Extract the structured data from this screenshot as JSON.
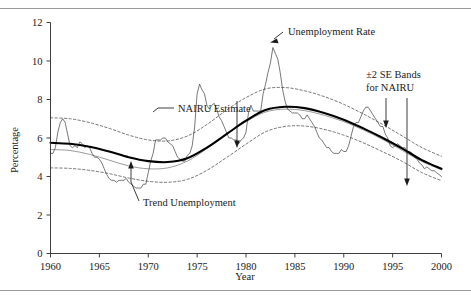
{
  "figure": {
    "y_axis_title": "Percentage",
    "x_axis_title": "Year"
  },
  "annotations": {
    "nairu": "NAIRU Estimate",
    "trend": "Trend Unemployment",
    "unemployment": "Unemployment Rate",
    "bands_line1": "±2 SE Bands",
    "bands_line2": "for NAIRU"
  },
  "ticks": {
    "y": [
      "0",
      "2",
      "4",
      "6",
      "8",
      "10",
      "12"
    ],
    "x": [
      "1960",
      "1965",
      "1970",
      "1975",
      "1980",
      "1985",
      "1990",
      "1995",
      "2000"
    ]
  },
  "chart_data": {
    "type": "line",
    "title": "",
    "xlabel": "Year",
    "ylabel": "Percentage",
    "xlim": [
      1960,
      2000
    ],
    "ylim": [
      0,
      12
    ],
    "yticks": [
      0,
      2,
      4,
      6,
      8,
      10,
      12
    ],
    "xticks": [
      1960,
      1965,
      1970,
      1975,
      1980,
      1985,
      1990,
      1995,
      2000
    ],
    "grid": false,
    "legend": "annotations-with-leader-lines",
    "colors": {
      "unemployment": "#3d3d3d",
      "nairu": "#000000",
      "trend": "#8f8f8f",
      "se_bands": "#4a4a4a"
    },
    "series": [
      {
        "name": "Unemployment Rate",
        "style": "solid-thin",
        "x": [
          1960.0,
          1960.25,
          1960.5,
          1960.75,
          1961.0,
          1961.25,
          1961.5,
          1961.75,
          1962.0,
          1962.25,
          1962.5,
          1962.75,
          1963.0,
          1963.25,
          1963.5,
          1963.75,
          1964.0,
          1964.25,
          1964.5,
          1964.75,
          1965.0,
          1965.25,
          1965.5,
          1965.75,
          1966.0,
          1966.25,
          1966.5,
          1966.75,
          1967.0,
          1967.25,
          1967.5,
          1967.75,
          1968.0,
          1968.25,
          1968.5,
          1968.75,
          1969.0,
          1969.25,
          1969.5,
          1969.75,
          1970.0,
          1970.25,
          1970.5,
          1970.75,
          1971.0,
          1971.25,
          1971.5,
          1971.75,
          1972.0,
          1972.25,
          1972.5,
          1972.75,
          1973.0,
          1973.25,
          1973.5,
          1973.75,
          1974.0,
          1974.25,
          1974.5,
          1974.75,
          1975.0,
          1975.25,
          1975.5,
          1975.75,
          1976.0,
          1976.25,
          1976.5,
          1976.75,
          1977.0,
          1977.25,
          1977.5,
          1977.75,
          1978.0,
          1978.25,
          1978.5,
          1978.75,
          1979.0,
          1979.25,
          1979.5,
          1979.75,
          1980.0,
          1980.25,
          1980.5,
          1980.75,
          1981.0,
          1981.25,
          1981.5,
          1981.75,
          1982.0,
          1982.25,
          1982.5,
          1982.75,
          1983.0,
          1983.25,
          1983.5,
          1983.75,
          1984.0,
          1984.25,
          1984.5,
          1984.75,
          1985.0,
          1985.25,
          1985.5,
          1985.75,
          1986.0,
          1986.25,
          1986.5,
          1986.75,
          1987.0,
          1987.25,
          1987.5,
          1987.75,
          1988.0,
          1988.25,
          1988.5,
          1988.75,
          1989.0,
          1989.25,
          1989.5,
          1989.75,
          1990.0,
          1990.25,
          1990.5,
          1990.75,
          1991.0,
          1991.25,
          1991.5,
          1991.75,
          1992.0,
          1992.25,
          1992.5,
          1992.75,
          1993.0,
          1993.25,
          1993.5,
          1993.75,
          1994.0,
          1994.25,
          1994.5,
          1994.75,
          1995.0,
          1995.25,
          1995.5,
          1995.75,
          1996.0,
          1996.25,
          1996.5,
          1996.75,
          1997.0,
          1997.25,
          1997.5,
          1997.75,
          1998.0,
          1998.25,
          1998.5,
          1998.75,
          1999.0,
          1999.25,
          1999.5,
          1999.75,
          2000.0
        ],
        "values": [
          5.2,
          5.2,
          5.5,
          6.3,
          6.8,
          7.0,
          6.8,
          6.2,
          5.6,
          5.5,
          5.6,
          5.5,
          5.8,
          5.7,
          5.5,
          5.6,
          5.5,
          5.2,
          5.0,
          5.0,
          4.9,
          4.7,
          4.4,
          4.1,
          3.9,
          3.8,
          3.8,
          3.7,
          3.8,
          3.8,
          3.8,
          3.9,
          3.7,
          3.6,
          3.5,
          3.4,
          3.4,
          3.4,
          3.6,
          3.6,
          4.2,
          4.8,
          5.2,
          5.9,
          5.9,
          5.9,
          6.0,
          6.0,
          5.8,
          5.7,
          5.6,
          5.3,
          5.0,
          4.9,
          4.8,
          4.8,
          5.1,
          5.2,
          5.6,
          6.6,
          8.3,
          8.8,
          8.5,
          8.3,
          7.7,
          7.5,
          7.7,
          7.8,
          7.5,
          7.1,
          6.9,
          6.6,
          6.3,
          6.0,
          6.0,
          5.9,
          5.9,
          5.7,
          5.9,
          6.0,
          6.3,
          7.3,
          7.7,
          7.4,
          7.4,
          7.4,
          7.4,
          8.3,
          8.8,
          9.4,
          9.9,
          10.7,
          10.4,
          10.1,
          9.4,
          8.5,
          7.9,
          7.5,
          7.4,
          7.3,
          7.3,
          7.3,
          7.2,
          7.0,
          7.0,
          7.2,
          7.0,
          6.8,
          6.6,
          6.3,
          6.0,
          5.9,
          5.7,
          5.5,
          5.5,
          5.3,
          5.2,
          5.2,
          5.2,
          5.4,
          5.3,
          5.3,
          5.6,
          6.1,
          6.6,
          6.8,
          6.8,
          7.1,
          7.4,
          7.6,
          7.6,
          7.4,
          7.2,
          7.0,
          6.8,
          6.6,
          6.6,
          6.2,
          6.0,
          5.6,
          5.5,
          5.6,
          5.7,
          5.6,
          5.5,
          5.5,
          5.3,
          5.3,
          5.2,
          5.0,
          4.9,
          4.7,
          4.6,
          4.4,
          4.5,
          4.4,
          4.3,
          4.3,
          4.2,
          4.1,
          4.0
        ]
      },
      {
        "name": "NAIRU Estimate",
        "style": "solid-thick",
        "x": [
          1960,
          1962,
          1964,
          1966,
          1968,
          1970,
          1972,
          1974,
          1976,
          1978,
          1980,
          1982,
          1984,
          1986,
          1988,
          1990,
          1992,
          1994,
          1996,
          1998,
          2000
        ],
        "values": [
          5.75,
          5.7,
          5.55,
          5.3,
          5.0,
          4.8,
          4.75,
          4.95,
          5.5,
          6.2,
          6.9,
          7.45,
          7.62,
          7.55,
          7.3,
          6.95,
          6.5,
          6.0,
          5.45,
          4.85,
          4.4
        ]
      },
      {
        "name": "Trend Unemployment",
        "style": "solid-gray",
        "x": [
          1960,
          1962,
          1964,
          1966,
          1968,
          1970,
          1972,
          1974,
          1976,
          1978,
          1980,
          1982,
          1984,
          1986,
          1988,
          1990,
          1992,
          1994,
          1996,
          1998,
          2000
        ],
        "values": [
          5.4,
          5.35,
          5.15,
          4.85,
          4.55,
          4.4,
          4.45,
          4.8,
          5.45,
          6.2,
          6.85,
          7.35,
          7.5,
          7.42,
          7.18,
          6.85,
          6.42,
          5.92,
          5.35,
          4.78,
          4.35
        ]
      },
      {
        "name": "+2 SE Band",
        "style": "dashed",
        "x": [
          1960,
          1962,
          1964,
          1966,
          1968,
          1970,
          1972,
          1974,
          1976,
          1978,
          1980,
          1982,
          1984,
          1986,
          1988,
          1990,
          1992,
          1994,
          1996,
          1998,
          2000
        ],
        "values": [
          7.05,
          7.0,
          6.8,
          6.5,
          6.15,
          5.9,
          5.85,
          6.1,
          6.7,
          7.45,
          8.1,
          8.55,
          8.62,
          8.45,
          8.15,
          7.75,
          7.25,
          6.7,
          6.1,
          5.5,
          5.05
        ]
      },
      {
        "name": "-2 SE Band",
        "style": "dashed",
        "x": [
          1960,
          1962,
          1964,
          1966,
          1968,
          1970,
          1972,
          1974,
          1976,
          1978,
          1980,
          1982,
          1984,
          1986,
          1988,
          1990,
          1992,
          1994,
          1996,
          1998,
          2000
        ],
        "values": [
          4.45,
          4.42,
          4.32,
          4.15,
          3.92,
          3.75,
          3.7,
          3.85,
          4.32,
          4.98,
          5.68,
          6.32,
          6.6,
          6.62,
          6.45,
          6.15,
          5.75,
          5.28,
          4.78,
          4.2,
          3.78
        ]
      }
    ],
    "annotations": [
      {
        "text": "NAIRU Estimate",
        "points_to_year": 1971.2,
        "points_to_value": 5.05
      },
      {
        "text": "Trend Unemployment",
        "points_to_year": 1968.6,
        "points_to_value": 3.35
      },
      {
        "text": "Unemployment Rate",
        "points_to_year": 1982.6,
        "points_to_value": 10.5
      },
      {
        "text": "±2 SE Bands for NAIRU",
        "points_to_year": 1995.8,
        "points_to_value": 6.05
      }
    ]
  }
}
